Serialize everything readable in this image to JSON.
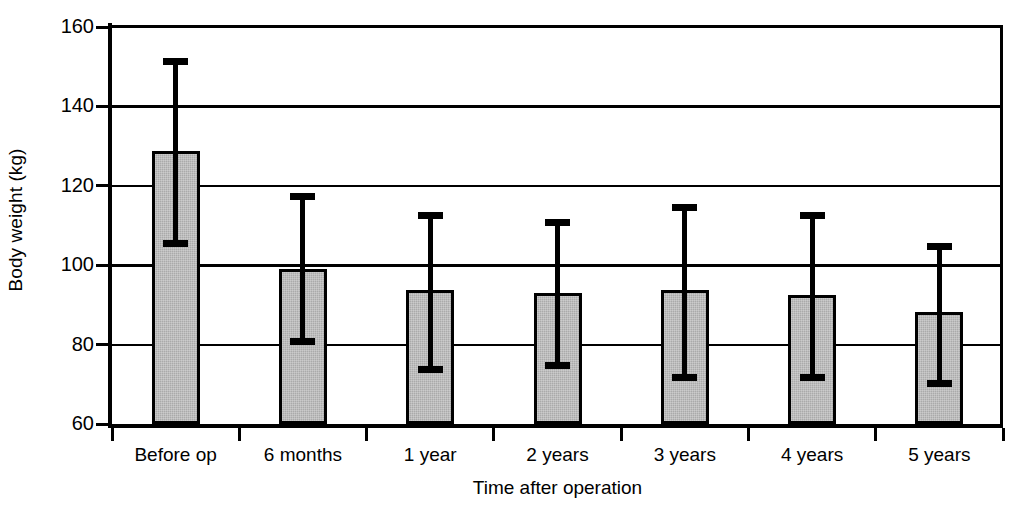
{
  "chart_data": {
    "type": "bar",
    "title": "",
    "xlabel": "Time after operation",
    "ylabel": "Body weight (kg)",
    "categories": [
      "Before op",
      "6 months",
      "1 year",
      "2 years",
      "3 years",
      "4 years",
      "5 years"
    ],
    "values": [
      128.8,
      99.0,
      93.7,
      93.1,
      93.8,
      92.4,
      88.2
    ],
    "error_high": [
      151.4,
      117.3,
      112.5,
      110.8,
      114.5,
      112.6,
      104.6
    ],
    "error_low": [
      105.4,
      80.8,
      73.8,
      74.7,
      71.8,
      71.7,
      70.3
    ],
    "ylim": [
      60,
      160
    ],
    "yticks": [
      60,
      80,
      100,
      120,
      140,
      160
    ],
    "ytick_labels": [
      "60",
      "80",
      "100",
      "120",
      "140",
      "160"
    ],
    "gridlines": [
      80,
      100,
      120,
      140
    ],
    "grid": true,
    "legend": null,
    "series_name": "Body weight",
    "bar_fill_color": "#aaaaaa",
    "bar_border_color": "#000000",
    "error_bar_color": "#000000"
  },
  "axis": {
    "y_title": "Body weight (kg)",
    "x_title": "Time after operation"
  }
}
